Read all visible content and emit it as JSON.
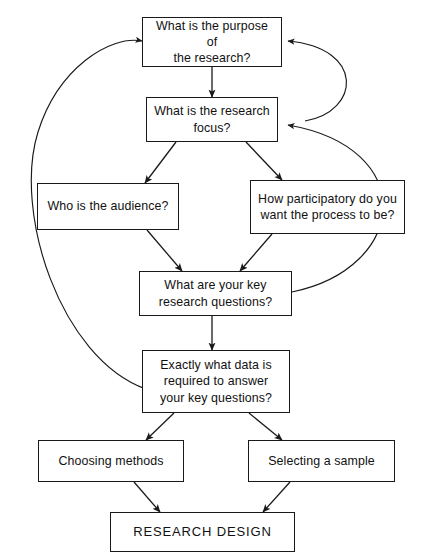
{
  "diagram": {
    "background": "#ffffff",
    "stroke_color": "#1a1a1a",
    "text_color": "#111111",
    "nodes": [
      {
        "id": "purpose",
        "label": "What is the purpose of\nthe research?",
        "name": "node-purpose-of-research"
      },
      {
        "id": "focus",
        "label": "What is the research\nfocus?",
        "name": "node-research-focus"
      },
      {
        "id": "audience",
        "label": "Who is the audience?",
        "name": "node-audience"
      },
      {
        "id": "participatory",
        "label": "How participatory do you\nwant the process to be?",
        "name": "node-participatory"
      },
      {
        "id": "questions",
        "label": "What are your key\nresearch questions?",
        "name": "node-key-research-questions"
      },
      {
        "id": "data",
        "label": "Exactly what data is\nrequired to answer\nyour key questions?",
        "name": "node-required-data"
      },
      {
        "id": "methods",
        "label": "Choosing methods",
        "name": "node-choosing-methods"
      },
      {
        "id": "sample",
        "label": "Selecting a sample",
        "name": "node-selecting-a-sample"
      },
      {
        "id": "design",
        "label": "RESEARCH DESIGN",
        "name": "node-research-design"
      }
    ],
    "edges": [
      {
        "id": "e1",
        "from": "purpose",
        "to": "focus",
        "style": "straight-down"
      },
      {
        "id": "e2",
        "from": "focus",
        "to": "audience",
        "style": "diagonal-down-left"
      },
      {
        "id": "e3",
        "from": "focus",
        "to": "participatory",
        "style": "diagonal-down-right"
      },
      {
        "id": "e4",
        "from": "audience",
        "to": "questions",
        "style": "diagonal-down-right"
      },
      {
        "id": "e5",
        "from": "participatory",
        "to": "questions",
        "style": "diagonal-down-left"
      },
      {
        "id": "e6",
        "from": "questions",
        "to": "data",
        "style": "straight-down"
      },
      {
        "id": "e7",
        "from": "data",
        "to": "methods",
        "style": "diagonal-down-left"
      },
      {
        "id": "e8",
        "from": "data",
        "to": "sample",
        "style": "diagonal-down-right"
      },
      {
        "id": "e9",
        "from": "methods",
        "to": "design",
        "style": "diagonal-down-right"
      },
      {
        "id": "e10",
        "from": "sample",
        "to": "design",
        "style": "diagonal-down-left"
      },
      {
        "id": "e11",
        "from": "participatory",
        "to": "purpose",
        "style": "feedback-curve-right"
      },
      {
        "id": "e12",
        "from": "questions",
        "to": "focus",
        "style": "feedback-curve-right-long"
      },
      {
        "id": "e13",
        "from": "data",
        "to": "purpose",
        "style": "feedback-curve-left-long"
      }
    ]
  }
}
